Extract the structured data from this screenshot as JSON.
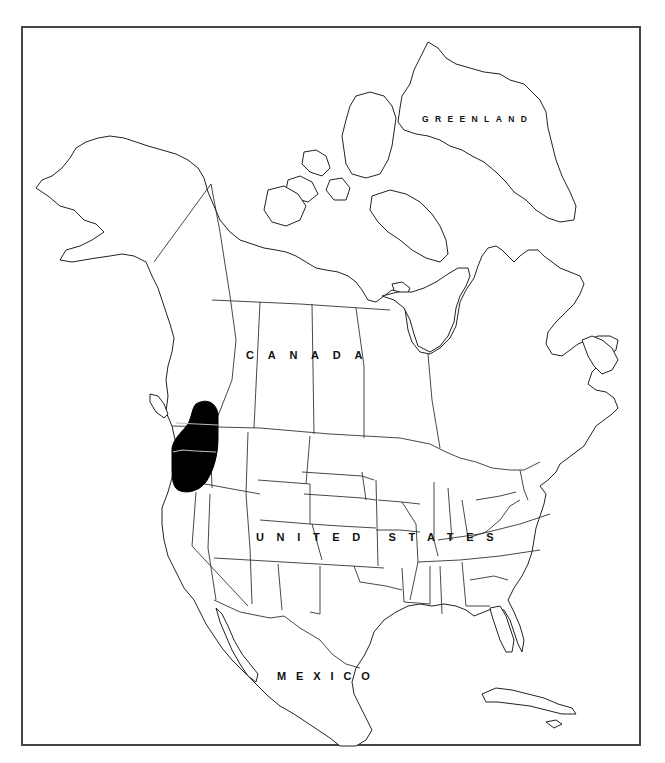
{
  "map": {
    "title": "Distribution map of North America",
    "frame_color": "#444444",
    "range_color": "#000000",
    "labels": {
      "greenland": "GREENLAND",
      "canada": "CANADA",
      "united_states": "UNITED STATES",
      "mexico": "MEXICO"
    },
    "highlighted_range": {
      "description": "Pacific Northwest range — southern British Columbia, eastern Washington, Oregon",
      "approx_bbox_px": [
        172,
        400,
        218,
        492
      ]
    }
  }
}
